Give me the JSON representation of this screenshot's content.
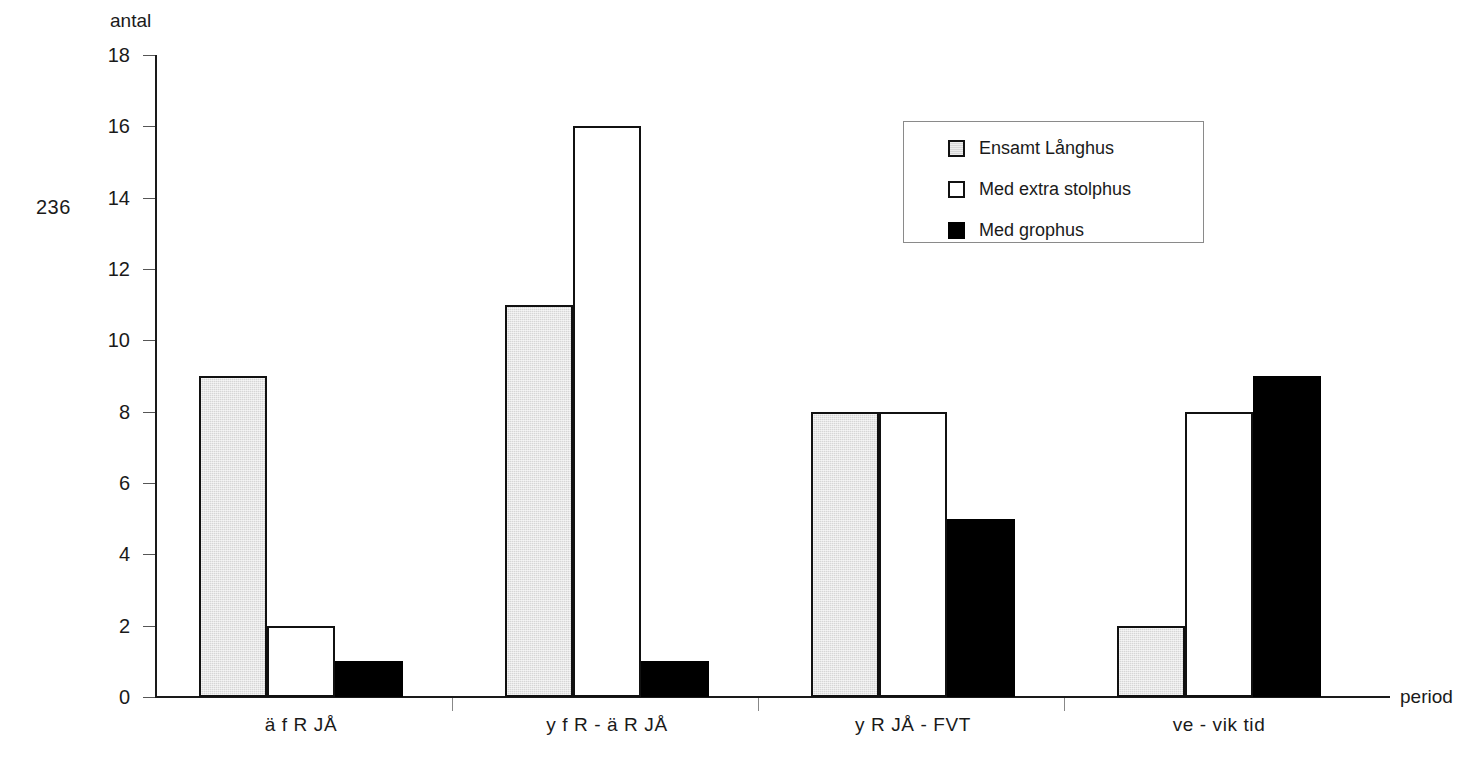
{
  "page": {
    "page_number": "236"
  },
  "chart_data": {
    "type": "bar",
    "title": "",
    "xlabel": "period",
    "ylabel": "antal",
    "ylim": [
      0,
      18
    ],
    "yticks": [
      0,
      2,
      4,
      6,
      8,
      10,
      12,
      14,
      16,
      18
    ],
    "ytick_labels": [
      "0",
      "2",
      "4",
      "6",
      "8",
      "10",
      "12",
      "14",
      "16",
      "18"
    ],
    "grid": false,
    "legend_position": "upper right",
    "categories": [
      "ä f R JÅ",
      "y f R - ä R JÅ",
      "y R JÅ - FVT",
      "ve - vik tid"
    ],
    "series": [
      {
        "name": "Ensamt Långhus",
        "color": "#d6d6d6",
        "values": [
          9,
          11,
          8,
          2
        ]
      },
      {
        "name": "Med extra stolphus",
        "color": "#ffffff",
        "values": [
          2,
          16,
          8,
          8
        ]
      },
      {
        "name": "Med grophus",
        "color": "#000000",
        "values": [
          1,
          1,
          5,
          9
        ]
      }
    ]
  }
}
